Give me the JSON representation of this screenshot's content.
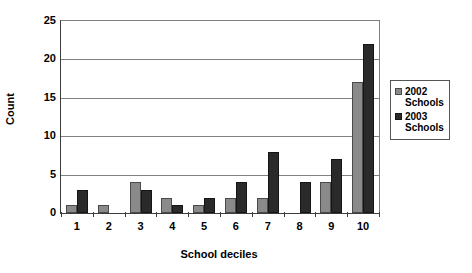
{
  "chart_data": {
    "type": "bar",
    "title": "",
    "xlabel": "School deciles",
    "ylabel": "Count",
    "categories": [
      "1",
      "2",
      "3",
      "4",
      "5",
      "6",
      "7",
      "8",
      "9",
      "10"
    ],
    "series": [
      {
        "name": "2002 Schools",
        "color": "#8a8a8a",
        "values": [
          1,
          1,
          4,
          2,
          1,
          2,
          2,
          0,
          4,
          17
        ]
      },
      {
        "name": "2003 Schools",
        "color": "#2a2a2a",
        "values": [
          3,
          0,
          3,
          1,
          2,
          4,
          8,
          4,
          7,
          22
        ]
      }
    ],
    "ylim": [
      0,
      25
    ],
    "yticks": [
      0,
      5,
      10,
      15,
      20,
      25
    ],
    "grid": true,
    "legend_position": "right"
  },
  "legend": {
    "entries": [
      {
        "year": "2002",
        "sub": "Schools"
      },
      {
        "year": "2003",
        "sub": "Schools"
      }
    ]
  }
}
